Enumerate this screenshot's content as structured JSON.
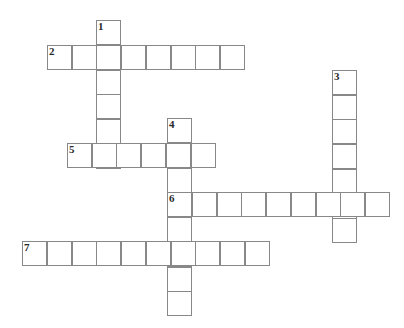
{
  "puzzle": {
    "title": "Crossword Grid",
    "geometry": {
      "cell_size": 24.75,
      "origin_x": 22,
      "origin_y": 20,
      "canvas_width": 404,
      "canvas_height": 328
    },
    "colors": {
      "cell_fill": "#ffffff",
      "cell_border": "#888888",
      "number_text": "#2a2a2a",
      "background": "#ffffff"
    },
    "entries": [
      {
        "number": "1",
        "direction": "down",
        "start_col": 3,
        "start_row": 0,
        "length": 6
      },
      {
        "number": "2",
        "direction": "across",
        "start_col": 1,
        "start_row": 1,
        "length": 8
      },
      {
        "number": "3",
        "direction": "down",
        "start_col": 12.525,
        "start_row": 2.02,
        "length": 7
      },
      {
        "number": "4",
        "direction": "down",
        "start_col": 5.859,
        "start_row": 3.96,
        "length": 8
      },
      {
        "number": "5",
        "direction": "across",
        "start_col": 1.818,
        "start_row": 4.97,
        "length": 6
      },
      {
        "number": "6",
        "direction": "across",
        "start_col": 5.859,
        "start_row": 6.95,
        "length": 9
      },
      {
        "number": "7",
        "direction": "across",
        "start_col": 0,
        "start_row": 8.93,
        "length": 10
      }
    ],
    "numbered_cells": [
      {
        "label": "1",
        "col": 3,
        "row": 0
      },
      {
        "label": "2",
        "col": 1,
        "row": 1
      },
      {
        "label": "3",
        "col": 12.525,
        "row": 2.02
      },
      {
        "label": "4",
        "col": 5.859,
        "row": 3.96
      },
      {
        "label": "5",
        "col": 1.818,
        "row": 4.97
      },
      {
        "label": "6",
        "col": 5.859,
        "row": 6.95
      },
      {
        "label": "7",
        "col": 0,
        "row": 8.93
      }
    ]
  }
}
